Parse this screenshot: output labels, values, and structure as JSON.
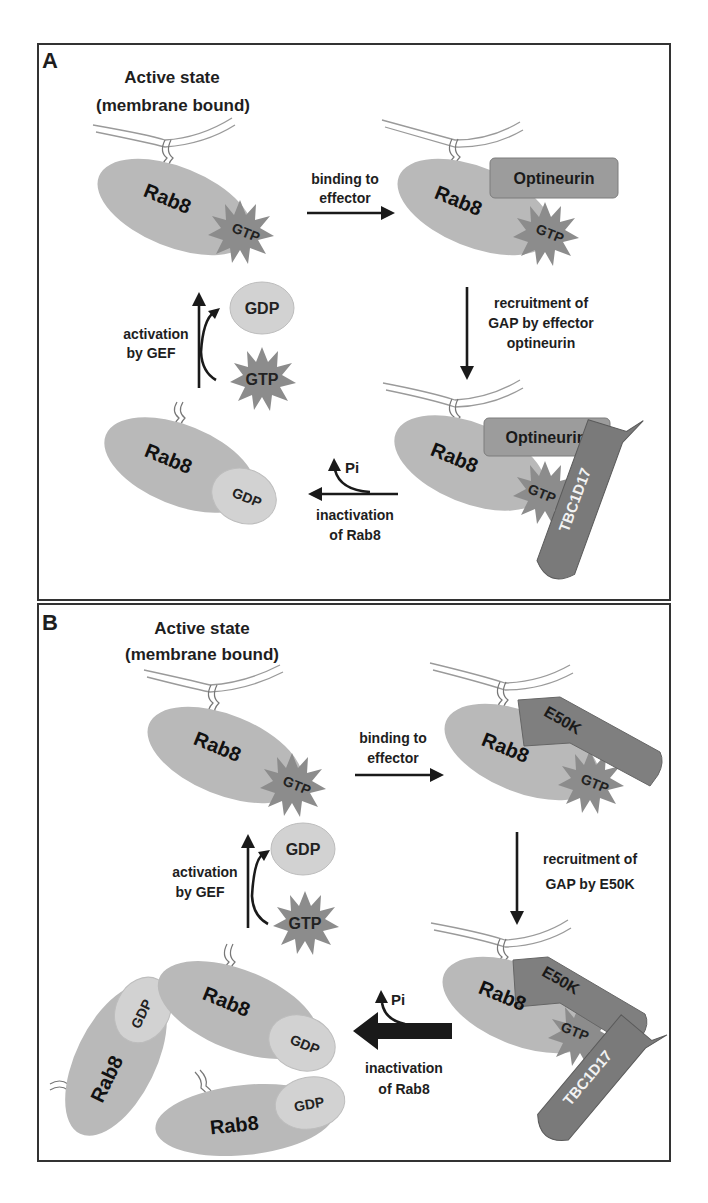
{
  "figure": {
    "panels": [
      {
        "letter": "A",
        "title_line1": "Active state",
        "title_line2": "(membrane bound)",
        "step_binding_line1": "binding to",
        "step_binding_line2": "effector",
        "step_recruit_line1": "recruitment of",
        "step_recruit_line2": "GAP by effector",
        "step_recruit_line3": "optineurin",
        "step_inactivation_line1": "inactivation",
        "step_inactivation_line2": "of Rab8",
        "step_activation_line1": "activation",
        "step_activation_line2": "by GEF",
        "pi_label": "Pi",
        "effector_label": "Optineurin",
        "gap_label": "TBC1D17",
        "rab_label": "Rab8",
        "gtp_label": "GTP",
        "gdp_label": "GDP"
      },
      {
        "letter": "B",
        "title_line1": "Active state",
        "title_line2": "(membrane bound)",
        "step_binding_line1": "binding to",
        "step_binding_line2": "effector",
        "step_recruit_line1": "recruitment of",
        "step_recruit_line2": "GAP by E50K",
        "step_inactivation_line1": "inactivation",
        "step_inactivation_line2": "of Rab8",
        "step_activation_line1": "activation",
        "step_activation_line2": "by GEF",
        "pi_label": "Pi",
        "effector_label": "E50K",
        "gap_label": "TBC1D17",
        "rab_label": "Rab8",
        "gtp_label": "GTP",
        "gdp_label": "GDP"
      }
    ],
    "colors": {
      "rab_body": "#b9b9b9",
      "gtp_star": "#8c8c8c",
      "gdp_oval": "#d2d2d2",
      "optineurin": "#9c9c9c",
      "e50k": "#7f7f7f",
      "tbc1d17": "#7a7a7a",
      "arrow": "#1a1a1a",
      "border": "#333333"
    }
  }
}
